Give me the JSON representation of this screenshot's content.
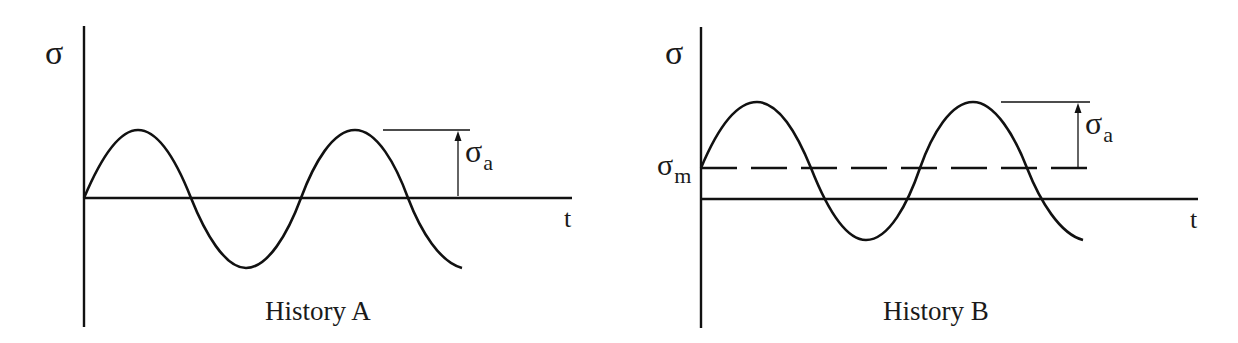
{
  "diagrams": [
    {
      "id": "A",
      "caption": "History A",
      "y_axis_label": "σ",
      "x_axis_label": "t",
      "amplitude_label": {
        "symbol": "σ",
        "subscript": "a"
      },
      "mean_label": null,
      "description": "Fully reversed sinusoidal stress history about zero mean"
    },
    {
      "id": "B",
      "caption": "History B",
      "y_axis_label": "σ",
      "x_axis_label": "t",
      "amplitude_label": {
        "symbol": "σ",
        "subscript": "a"
      },
      "mean_label": {
        "symbol": "σ",
        "subscript": "m"
      },
      "description": "Sinusoidal stress history with nonzero mean stress σm"
    }
  ],
  "style": {
    "stroke_color": "#111111",
    "background": "#ffffff"
  }
}
